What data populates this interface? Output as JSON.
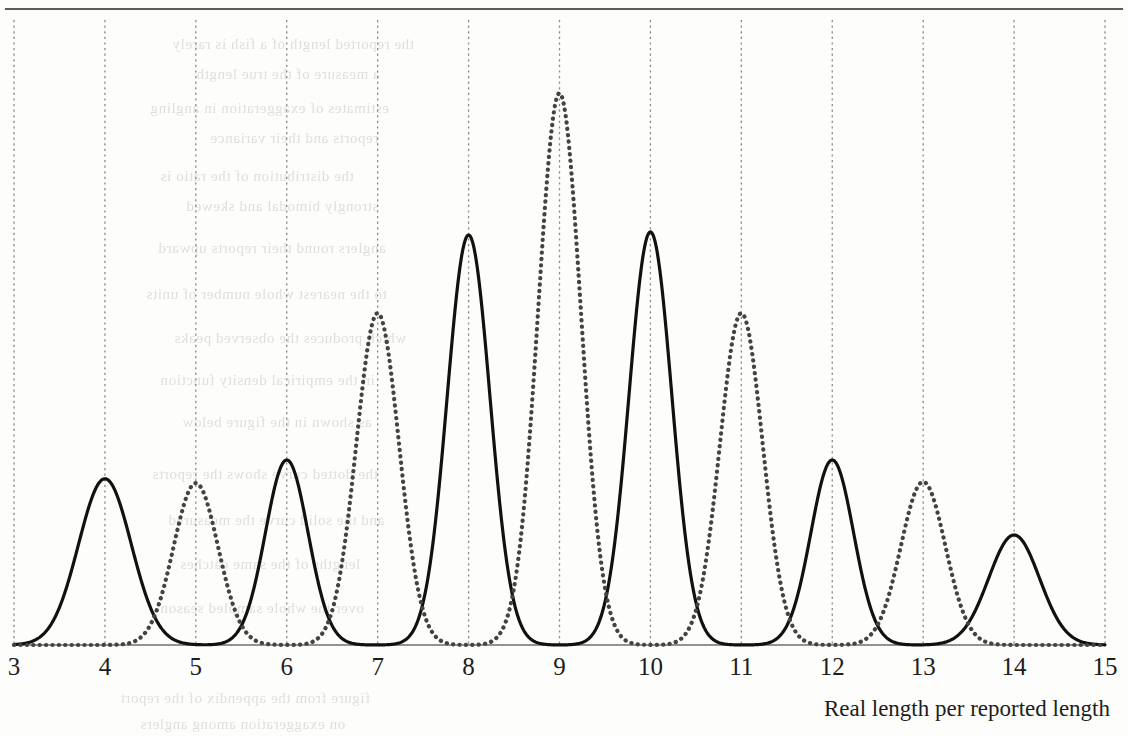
{
  "figure": {
    "axis_title": "Real length per reported length",
    "rule_color": "#5b5b5b",
    "background_color": "#fdfdfb"
  },
  "chart_data": {
    "type": "line",
    "title": "",
    "xlabel": "Real length per reported length",
    "ylabel": "",
    "xlim": [
      3,
      15
    ],
    "ylim": [
      0,
      1
    ],
    "grid": true,
    "grid_style": "dotted-vertical",
    "grid_color": "#8a8a8a",
    "legend": "none",
    "xticks": [
      3,
      4,
      5,
      6,
      7,
      8,
      9,
      10,
      11,
      12,
      13,
      14,
      15
    ],
    "xtick_labels": [
      "3",
      "4",
      "5",
      "6",
      "7",
      "8",
      "9",
      "10",
      "11",
      "12",
      "13",
      "14",
      "15"
    ],
    "yaxis_visible": false,
    "baseline": 0,
    "series": [
      {
        "name": "solid",
        "style": "solid",
        "color": "#111111",
        "width": 3.2,
        "description": "Solid black multi-modal density with peaks at even reported-length ratios",
        "peaks": [
          {
            "x": 4,
            "height": 0.266,
            "sigma": 0.29
          },
          {
            "x": 6,
            "height": 0.296,
            "sigma": 0.235
          },
          {
            "x": 8,
            "height": 0.656,
            "sigma": 0.235
          },
          {
            "x": 10,
            "height": 0.661,
            "sigma": 0.235
          },
          {
            "x": 12,
            "height": 0.296,
            "sigma": 0.235
          },
          {
            "x": 14,
            "height": 0.176,
            "sigma": 0.28
          }
        ]
      },
      {
        "name": "dotted",
        "style": "dotted",
        "color": "#434343",
        "width": 4.2,
        "description": "Dotted dark-grey multi-modal density with peaks at odd reported-length ratios",
        "peaks": [
          {
            "x": 5,
            "height": 0.259,
            "sigma": 0.245
          },
          {
            "x": 7,
            "height": 0.531,
            "sigma": 0.235
          },
          {
            "x": 9,
            "height": 0.883,
            "sigma": 0.235
          },
          {
            "x": 11,
            "height": 0.531,
            "sigma": 0.235
          },
          {
            "x": 13,
            "height": 0.261,
            "sigma": 0.245
          }
        ]
      }
    ]
  },
  "bleed_through": [
    {
      "top": 36,
      "left": 172,
      "text": "the reported length of a fish is rarely"
    },
    {
      "top": 66,
      "left": 196,
      "text": "a measure of the true length"
    },
    {
      "top": 100,
      "left": 150,
      "text": "estimates of exaggeration in angling"
    },
    {
      "top": 130,
      "left": 210,
      "text": "reports and their variance"
    },
    {
      "top": 168,
      "left": 160,
      "text": "the distribution of the ratio is"
    },
    {
      "top": 198,
      "left": 186,
      "text": "strongly bimodal and skewed"
    },
    {
      "top": 240,
      "left": 158,
      "text": "anglers round their reports upward"
    },
    {
      "top": 286,
      "left": 146,
      "text": "to the nearest whole number of units"
    },
    {
      "top": 330,
      "left": 174,
      "text": "which produces the observed peaks"
    },
    {
      "top": 372,
      "left": 160,
      "text": "in the empirical density function"
    },
    {
      "top": 414,
      "left": 182,
      "text": "as shown in the figure below"
    },
    {
      "top": 466,
      "left": 152,
      "text": "the dotted curve shows the reports"
    },
    {
      "top": 512,
      "left": 168,
      "text": "and the solid curve the measured"
    },
    {
      "top": 556,
      "left": 180,
      "text": "lengths of the same catches"
    },
    {
      "top": 600,
      "left": 160,
      "text": "over the whole sampled season"
    },
    {
      "top": 690,
      "left": 120,
      "text": "figure from the appendix of the report"
    },
    {
      "top": 716,
      "left": 140,
      "text": "on exaggeration among anglers"
    }
  ]
}
